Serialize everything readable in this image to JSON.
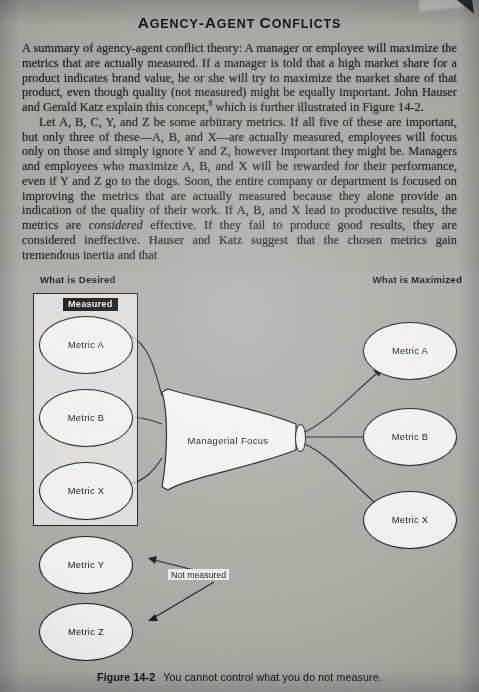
{
  "page": {
    "title": "Agency-Agent Conflicts"
  },
  "paragraphs": {
    "p1_a": "A summary of agency-agent conflict theory: A manager or employee will maximize the metrics that are actually measured. If a manager is told that a high market share for a product indicates brand value, he or she will try to maximize the market share of that product, even though quality (not measured) might be equally important. John Hauser and Gerald Katz explain this concept,",
    "p1_footnote": "8",
    "p1_b": " which is further illustrated in Figure 14-2.",
    "p2_a": "Let A, B, C, Y, and Z be some arbitrary metrics. If all five of these are important, but only three of these—A, B, and X—are actually measured, employees will focus only on those and simply ignore Y and Z, however important they might be. Managers and employees who maximize A, B, and X will be rewarded for their performance, even if Y and Z go to the dogs. Soon, the entire company or department is focused on improving the metrics that are actually measured because they alone provide an indication of the quality of their work. If A, B, and X lead to productive results, the metrics are ",
    "p2_italic": "considered",
    "p2_b": " effective. If they fail to produce good results, they are considered ineffective. Hauser and Katz suggest that the chosen metrics gain tremendous inertia and that"
  },
  "figure": {
    "headings": {
      "desired": "What is Desired",
      "maximized": "What is Maximized"
    },
    "measured_label": "Measured",
    "not_measured_label": "Not measured",
    "funnel_label": "Managerial  Focus",
    "desired_nodes": [
      {
        "label": "Metric A",
        "measured": true
      },
      {
        "label": "Metric B",
        "measured": true
      },
      {
        "label": "Metric X",
        "measured": true
      },
      {
        "label": "Metric Y",
        "measured": false
      },
      {
        "label": "Metric Z",
        "measured": false
      }
    ],
    "maximized_nodes": [
      {
        "label": "Metric A"
      },
      {
        "label": "Metric B"
      },
      {
        "label": "Metric X"
      }
    ],
    "caption_number": "Figure 14-2",
    "caption_text": "You cannot control what you do not measure."
  }
}
